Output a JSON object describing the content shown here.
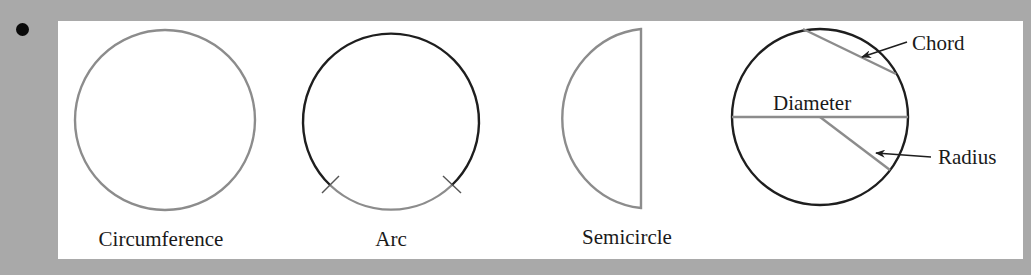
{
  "bullet": "•",
  "figures": [
    {
      "id": "circumference",
      "label": "Circumference"
    },
    {
      "id": "arc",
      "label": "Arc"
    },
    {
      "id": "semicircle",
      "label": "Semicircle"
    },
    {
      "id": "circle-parts",
      "labels": {
        "chord": "Chord",
        "diameter": "Diameter",
        "radius": "Radius"
      }
    }
  ],
  "colors": {
    "background": "#a9a9a9",
    "panel": "#ffffff",
    "gray_stroke": "#8c8c8c",
    "dark_stroke": "#1e1e1e",
    "text": "#1a1a1a"
  }
}
